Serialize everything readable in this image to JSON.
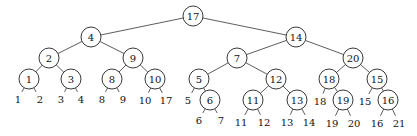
{
  "diagram": {
    "type": "binary-tree",
    "node_radius": 10,
    "internal_nodes": [
      {
        "id": "n17",
        "label": "17",
        "x": 193,
        "y": 16,
        "children": [
          "n4",
          "n14"
        ]
      },
      {
        "id": "n4",
        "label": "4",
        "x": 91,
        "y": 37,
        "children": [
          "n2",
          "n9"
        ]
      },
      {
        "id": "n14",
        "label": "14",
        "x": 296,
        "y": 37,
        "children": [
          "n7",
          "n20"
        ]
      },
      {
        "id": "n2",
        "label": "2",
        "x": 49,
        "y": 58,
        "children": [
          "n1",
          "n3"
        ]
      },
      {
        "id": "n9",
        "label": "9",
        "x": 133,
        "y": 58,
        "children": [
          "n8",
          "n10"
        ]
      },
      {
        "id": "n7",
        "label": "7",
        "x": 237,
        "y": 58,
        "children": [
          "n5",
          "n12"
        ]
      },
      {
        "id": "n20",
        "label": "20",
        "x": 353,
        "y": 58,
        "children": [
          "n18",
          "n15"
        ]
      },
      {
        "id": "n1",
        "label": "1",
        "x": 29,
        "y": 79,
        "children": [
          "l1",
          "l2"
        ]
      },
      {
        "id": "n3",
        "label": "3",
        "x": 71,
        "y": 79,
        "children": [
          "l3",
          "l4"
        ]
      },
      {
        "id": "n8",
        "label": "8",
        "x": 112,
        "y": 79,
        "children": [
          "l8",
          "l9"
        ]
      },
      {
        "id": "n10",
        "label": "10",
        "x": 155,
        "y": 79,
        "children": [
          "l10",
          "l17"
        ]
      },
      {
        "id": "n5",
        "label": "5",
        "x": 199,
        "y": 79,
        "children": [
          "l5",
          "n6"
        ]
      },
      {
        "id": "n12",
        "label": "12",
        "x": 276,
        "y": 79,
        "children": [
          "n11",
          "n13"
        ]
      },
      {
        "id": "n18",
        "label": "18",
        "x": 329,
        "y": 79,
        "children": [
          "l18",
          "n19"
        ]
      },
      {
        "id": "n15",
        "label": "15",
        "x": 377,
        "y": 79,
        "children": [
          "l15",
          "n16"
        ]
      },
      {
        "id": "n6",
        "label": "6",
        "x": 210,
        "y": 100,
        "children": [
          "l6",
          "l7"
        ]
      },
      {
        "id": "n11",
        "label": "11",
        "x": 253,
        "y": 100,
        "children": [
          "l11",
          "l12"
        ]
      },
      {
        "id": "n13",
        "label": "13",
        "x": 297,
        "y": 100,
        "children": [
          "l13",
          "l14"
        ]
      },
      {
        "id": "n19",
        "label": "19",
        "x": 343,
        "y": 100,
        "children": [
          "l19",
          "l20"
        ]
      },
      {
        "id": "n16",
        "label": "16",
        "x": 388,
        "y": 100,
        "children": [
          "l16",
          "l21"
        ]
      }
    ],
    "leaves": [
      {
        "id": "l1",
        "label": "1",
        "x": 18,
        "y": 99
      },
      {
        "id": "l2",
        "label": "2",
        "x": 40,
        "y": 99
      },
      {
        "id": "l3",
        "label": "3",
        "x": 61,
        "y": 99
      },
      {
        "id": "l4",
        "label": "4",
        "x": 81,
        "y": 99
      },
      {
        "id": "l8",
        "label": "8",
        "x": 102,
        "y": 99
      },
      {
        "id": "l9",
        "label": "9",
        "x": 123,
        "y": 99
      },
      {
        "id": "l10",
        "label": "10",
        "x": 145,
        "y": 100
      },
      {
        "id": "l17",
        "label": "17",
        "x": 166,
        "y": 100
      },
      {
        "id": "l5",
        "label": "5",
        "x": 188,
        "y": 100
      },
      {
        "id": "l6",
        "label": "6",
        "x": 199,
        "y": 120
      },
      {
        "id": "l7",
        "label": "7",
        "x": 221,
        "y": 120
      },
      {
        "id": "l11",
        "label": "11",
        "x": 241,
        "y": 122
      },
      {
        "id": "l12",
        "label": "12",
        "x": 264,
        "y": 122
      },
      {
        "id": "l13",
        "label": "13",
        "x": 287,
        "y": 122
      },
      {
        "id": "l14",
        "label": "14",
        "x": 309,
        "y": 122
      },
      {
        "id": "l18",
        "label": "18",
        "x": 320,
        "y": 101
      },
      {
        "id": "l19",
        "label": "19",
        "x": 332,
        "y": 123
      },
      {
        "id": "l20",
        "label": "20",
        "x": 354,
        "y": 123
      },
      {
        "id": "l15",
        "label": "15",
        "x": 365,
        "y": 101
      },
      {
        "id": "l16",
        "label": "16",
        "x": 377,
        "y": 123
      },
      {
        "id": "l21",
        "label": "21",
        "x": 399,
        "y": 123
      }
    ]
  }
}
